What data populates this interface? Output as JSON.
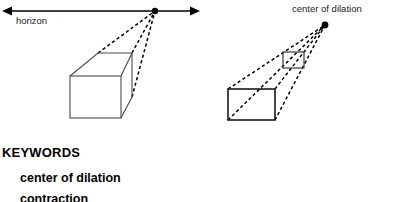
{
  "figure": {
    "left_diagram": {
      "name": "one-point-perspective-box",
      "horizon_label": "horizon",
      "horizon_line": {
        "x1": 2,
        "y1": 11,
        "x2": 200,
        "y2": 11,
        "arrow_left": true,
        "arrow_right": true
      },
      "vanishing_point": {
        "x": 155,
        "y": 11,
        "radius": 3.2
      },
      "box": {
        "front_face": {
          "x": 70,
          "y": 76,
          "width": 51,
          "height": 42
        },
        "back_top_left": {
          "x": 98,
          "y": 53
        },
        "back_top_right": {
          "x": 132,
          "y": 53
        },
        "back_bottom_right": {
          "x": 132,
          "y": 97
        }
      },
      "dashed_rays": [
        {
          "from_x": 98,
          "from_y": 53
        },
        {
          "from_x": 132,
          "from_y": 53
        },
        {
          "from_x": 132,
          "from_y": 97
        }
      ]
    },
    "right_diagram": {
      "name": "dilation-rectangles",
      "center_label": "center of dilation",
      "center_of_dilation": {
        "x": 325,
        "y": 25,
        "radius": 3.4
      },
      "image_rect": {
        "x": 283,
        "y": 52,
        "width": 21,
        "height": 16
      },
      "preimage_rect": {
        "x": 228,
        "y": 89,
        "width": 47,
        "height": 31
      },
      "ray_pairs": [
        {
          "from_x": 228,
          "from_y": 89,
          "via_x": 283,
          "via_y": 52
        },
        {
          "from_x": 275,
          "from_y": 89,
          "via_x": 304,
          "via_y": 52
        },
        {
          "from_x": 228,
          "from_y": 120,
          "via_x": 283,
          "via_y": 68
        },
        {
          "from_x": 275,
          "from_y": 120,
          "via_x": 304,
          "via_y": 68
        }
      ]
    },
    "stroke_color": "#000000",
    "box_stroke_color": "#444444",
    "dash_color": "#000000"
  },
  "keywords": {
    "heading": "KEYWORDS",
    "items": [
      "center of dilation",
      "contraction"
    ]
  }
}
